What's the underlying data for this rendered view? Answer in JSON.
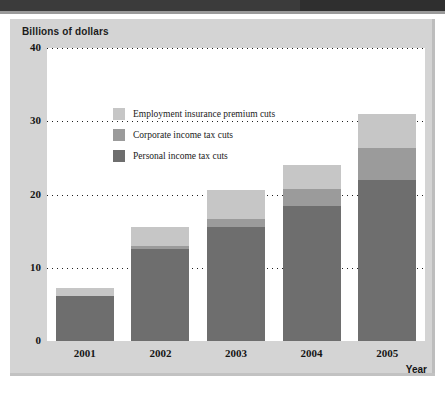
{
  "figure": {
    "title": "Billions of dollars",
    "axis_title_x": "Year"
  },
  "colors": {
    "personal": "#6e6e6e",
    "corporate": "#9b9b9b",
    "employment_insurance": "#c6c6c6",
    "panel_background": "#d4d4d4",
    "plot_background": "#ffffff",
    "gridline": "#1e1e1e",
    "text": "#161616"
  },
  "legend": {
    "position": "inside-top-left",
    "items": [
      {
        "label": "Employment insurance premium cuts",
        "key": "employment_insurance",
        "color": "#c6c6c6"
      },
      {
        "label": "Corporate income tax cuts",
        "key": "corporate",
        "color": "#9b9b9b"
      },
      {
        "label": "Personal income tax cuts",
        "key": "personal",
        "color": "#6e6e6e"
      }
    ]
  },
  "chart_data": {
    "type": "bar",
    "stacked": true,
    "title": "Billions of dollars",
    "subtitle": "",
    "xlabel": "Year",
    "ylabel": "Billions of dollars",
    "categories": [
      "2001",
      "2002",
      "2003",
      "2004",
      "2005"
    ],
    "ylim": [
      0,
      40
    ],
    "yticks": [
      0,
      10,
      20,
      30,
      40
    ],
    "ytick_labels": [
      "0",
      "10",
      "20",
      "30",
      "40"
    ],
    "grid": true,
    "grid_axis": "y",
    "grid_style": "dotted",
    "legend_position": "inside-top-left",
    "series": [
      {
        "name": "Personal income tax cuts",
        "color": "#6e6e6e",
        "values": [
          6.2,
          12.6,
          15.6,
          18.5,
          22.0
        ]
      },
      {
        "name": "Corporate income tax cuts",
        "color": "#9b9b9b",
        "values": [
          0.0,
          0.4,
          1.1,
          2.3,
          4.3
        ]
      },
      {
        "name": "Employment insurance premium cuts",
        "color": "#c6c6c6",
        "values": [
          1.0,
          2.6,
          3.9,
          3.2,
          4.7
        ]
      }
    ],
    "totals": [
      7.2,
      15.6,
      20.6,
      24.0,
      31.0
    ]
  }
}
